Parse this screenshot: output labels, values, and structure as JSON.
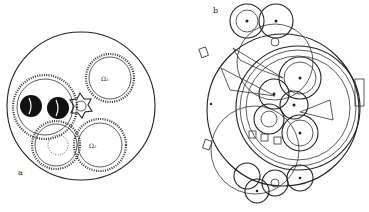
{
  "figure": {
    "panel_a": {
      "label": "a",
      "gear_marks": [
        "Ω₂",
        "Ω₂"
      ]
    },
    "panel_b": {
      "label": "b"
    }
  }
}
